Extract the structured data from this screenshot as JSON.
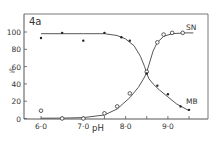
{
  "chart_data": {
    "type": "line",
    "panel_label": "4a",
    "title": "",
    "xlabel": "pH",
    "ylabel": "%",
    "xlim": [
      5.6,
      10.0
    ],
    "ylim": [
      0,
      120
    ],
    "xticks": [
      6.0,
      6.5,
      7.0,
      7.5,
      8.0,
      8.5,
      9.0,
      9.5
    ],
    "xtick_labels": [
      "6·0",
      "7·0",
      "8·0",
      "9·0"
    ],
    "xtick_label_values": [
      6.0,
      7.0,
      8.0,
      9.0
    ],
    "yticks": [
      0,
      20,
      40,
      60,
      80,
      100
    ],
    "grid": false,
    "series": [
      {
        "name": "SN",
        "marker": "open-circle",
        "points": [
          {
            "x": 6.0,
            "y": 9
          },
          {
            "x": 6.5,
            "y": 0
          },
          {
            "x": 7.0,
            "y": 0
          },
          {
            "x": 7.5,
            "y": 6
          },
          {
            "x": 7.8,
            "y": 14
          },
          {
            "x": 8.1,
            "y": 29
          },
          {
            "x": 8.5,
            "y": 54
          },
          {
            "x": 8.75,
            "y": 88
          },
          {
            "x": 8.9,
            "y": 97
          },
          {
            "x": 9.1,
            "y": 99
          },
          {
            "x": 9.35,
            "y": 99
          }
        ]
      },
      {
        "name": "MB",
        "marker": "filled-dot",
        "points": [
          {
            "x": 6.0,
            "y": 93
          },
          {
            "x": 6.5,
            "y": 99
          },
          {
            "x": 7.0,
            "y": 90
          },
          {
            "x": 7.5,
            "y": 99
          },
          {
            "x": 7.9,
            "y": 94
          },
          {
            "x": 8.1,
            "y": 90
          },
          {
            "x": 8.5,
            "y": 52
          },
          {
            "x": 8.75,
            "y": 38
          },
          {
            "x": 9.0,
            "y": 28
          },
          {
            "x": 9.3,
            "y": 14
          },
          {
            "x": 9.5,
            "y": 10
          }
        ]
      }
    ]
  },
  "labels": {
    "panel": "4a",
    "series_sn": "SN",
    "series_mb": "MB",
    "x_axis": "pH",
    "y_axis": "%"
  }
}
